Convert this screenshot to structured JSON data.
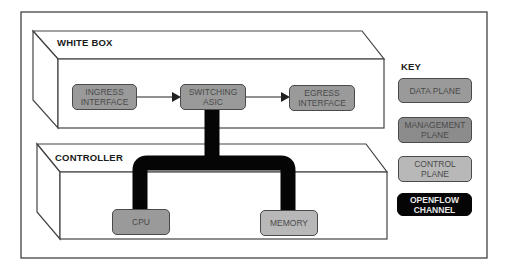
{
  "diagram": {
    "white_box": {
      "title": "WHITE BOX"
    },
    "controller": {
      "title": "CONTROLLER"
    },
    "nodes": {
      "ingress": {
        "line1": "INGRESS",
        "line2": "INTERFACE",
        "type": "data_plane"
      },
      "switching": {
        "line1": "SWITCHING",
        "line2": "ASIC",
        "type": "data_plane"
      },
      "egress": {
        "line1": "EGRESS",
        "line2": "INTERFACE",
        "type": "data_plane"
      },
      "cpu": {
        "line1": "CPU",
        "type": "control_plane"
      },
      "memory": {
        "line1": "MEMORY",
        "type": "control_plane"
      }
    },
    "edges": [
      {
        "from": "ingress",
        "to": "switching",
        "style": "arrow"
      },
      {
        "from": "switching",
        "to": "egress",
        "style": "arrow"
      },
      {
        "from": "switching",
        "to": "cpu",
        "style": "openflow_channel"
      },
      {
        "from": "switching",
        "to": "memory",
        "style": "openflow_channel"
      }
    ],
    "key": {
      "title": "KEY",
      "items": [
        {
          "line1": "DATA PLANE",
          "line2": "",
          "color": "#9a9a9a"
        },
        {
          "line1": "MANAGEMENT",
          "line2": "PLANE",
          "color": "#8c8c8c"
        },
        {
          "line1": "CONTROL",
          "line2": "PLANE",
          "color": "#b8b8b8"
        },
        {
          "line1": "OPENFLOW",
          "line2": "CHANNEL",
          "color": "#050505"
        }
      ]
    }
  }
}
